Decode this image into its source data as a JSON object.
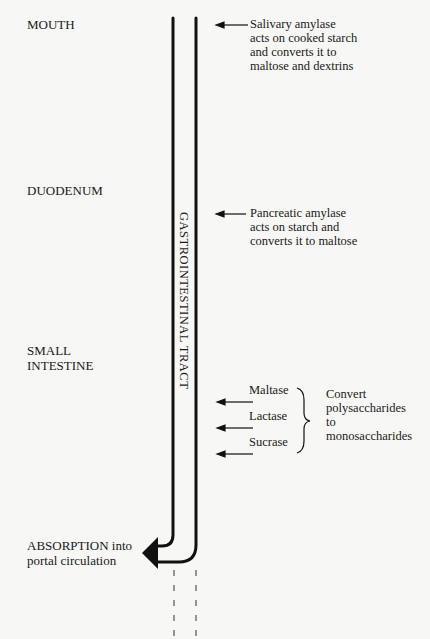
{
  "regions": {
    "mouth": "MOUTH",
    "duodenum": "DUODENUM",
    "small_intestine": "SMALL\nINTESTINE",
    "absorption": "ABSORPTION into\nportal circulation"
  },
  "tract_label": "GASTROINTESTINAL TRACT",
  "annotations": {
    "salivary": "Salivary amylase\nacts on cooked starch\nand converts it to\nmaltose and dextrins",
    "pancreatic": "Pancreatic amylase\nacts on starch and\nconverts it to maltose"
  },
  "enzymes": [
    {
      "label": "Maltase"
    },
    {
      "label": "Lactase"
    },
    {
      "label": "Sucrase"
    }
  ],
  "enzyme_effect": "Convert\npolysaccharides\nto\nmonosaccharides"
}
